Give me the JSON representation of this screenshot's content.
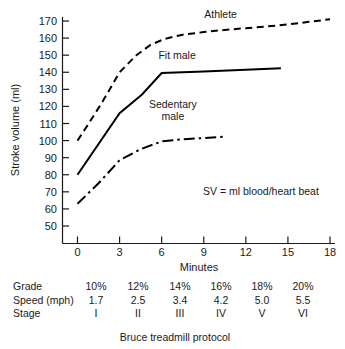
{
  "chart_data": {
    "type": "line",
    "title": "",
    "xlabel": "Minutes",
    "ylabel": "Stroke volume (ml)",
    "xlim": [
      0,
      18
    ],
    "ylim": [
      45,
      175
    ],
    "xticks": [
      "0",
      "3",
      "6",
      "9",
      "12",
      "15",
      "18"
    ],
    "yticks": [
      "50",
      "60",
      "70",
      "80",
      "90",
      "100",
      "110",
      "120",
      "130",
      "140",
      "150",
      "160",
      "170"
    ],
    "grid": false,
    "legend_position": "inline-labels",
    "annotation": "SV = ml blood/heart beat",
    "series": [
      {
        "name": "Athlete",
        "style": "dashed",
        "label_x": 10.2,
        "label_y": 172,
        "x": [
          0,
          0.8,
          1.8,
          3.0,
          4.2,
          5.2,
          6.2,
          7.5,
          9.0,
          10.5,
          12.0,
          13.5,
          15.0,
          16.5,
          18.0
        ],
        "y": [
          100,
          110,
          123,
          140,
          150,
          156,
          159.5,
          162,
          163.5,
          164.8,
          165.8,
          166.8,
          168,
          169.5,
          171
        ]
      },
      {
        "name": "Fit male",
        "style": "solid",
        "label_x": 7.1,
        "label_y": 148,
        "x": [
          0,
          3.0,
          4.6,
          6.0,
          9.0,
          12.0,
          14.5
        ],
        "y": [
          80,
          116,
          127,
          139.5,
          140.5,
          141.5,
          142.3
        ]
      },
      {
        "name": "Sedentary male",
        "style": "dash-dot",
        "label_x": 6.8,
        "label_y": 119,
        "label_lines": [
          "Sedentary",
          "male"
        ],
        "x": [
          0,
          1.5,
          3.0,
          4.5,
          6.0,
          7.5,
          9.0,
          10.4
        ],
        "y": [
          63,
          75,
          88.5,
          95,
          99.5,
          100.8,
          101.5,
          102.2
        ]
      }
    ]
  },
  "table": {
    "caption": "Bruce treadmill protocol",
    "rows": [
      {
        "label": "Grade",
        "values": [
          "10%",
          "12%",
          "14%",
          "16%",
          "18%",
          "20%"
        ]
      },
      {
        "label": "Speed (mph)",
        "values": [
          "1.7",
          "2.5",
          "3.4",
          "4.2",
          "5.0",
          "5.5"
        ]
      },
      {
        "label": "Stage",
        "values": [
          "I",
          "II",
          "III",
          "IV",
          "V",
          "VI"
        ]
      }
    ]
  },
  "colors": {
    "ink": "#1a1a1a",
    "curve": "#000000",
    "background": "#ffffff"
  }
}
